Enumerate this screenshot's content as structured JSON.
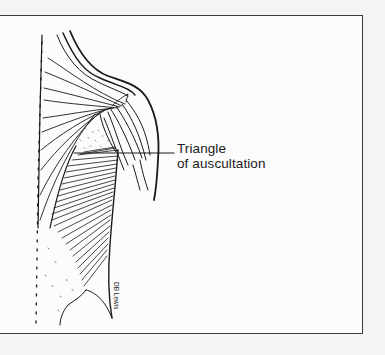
{
  "figure": {
    "label": {
      "line1": "Triangle",
      "line2": "of auscultation"
    },
    "signature": "DB Lewis",
    "colors": {
      "ink": "#1a1a1a",
      "paper": "#fcfcfc",
      "frame": "#3a3a3a"
    }
  }
}
